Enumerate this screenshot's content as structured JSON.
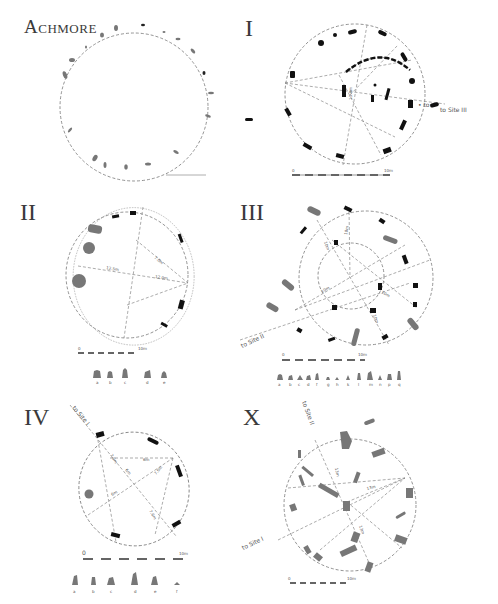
{
  "figure": {
    "panels": [
      {
        "id": "achmore",
        "title": "Achmore"
      },
      {
        "id": "site-1",
        "title": "I",
        "annotation": "to Site III",
        "radius_label": "13.4m",
        "scale": {
          "start": "0",
          "end": "10m"
        }
      },
      {
        "id": "site-2",
        "title": "II",
        "labels": [
          "12.5m",
          "12.0m",
          "7.0m"
        ],
        "scale": {
          "start": "0",
          "end": "10m"
        },
        "elevation_labels": [
          "a",
          "b",
          "c",
          "d",
          "e"
        ]
      },
      {
        "id": "site-3",
        "title": "III",
        "annotation": "to Site II",
        "labels": [
          "10m",
          "10m",
          "10m",
          "10m",
          "10m"
        ],
        "scale": {
          "start": "0",
          "end": "10m"
        },
        "elevation_labels": [
          "a",
          "b",
          "c",
          "d",
          "f",
          "g",
          "h",
          "k",
          "l",
          "m",
          "n",
          "p",
          "q"
        ]
      },
      {
        "id": "site-4",
        "title": "IV",
        "annotation": "to Site I",
        "labels": [
          "7.6m",
          "6m",
          "6m",
          "7.6m",
          "6m",
          "7.6m"
        ],
        "scale": {
          "start": "0",
          "end": "10m"
        },
        "elevation_labels": [
          "a",
          "b",
          "c",
          "d",
          "e",
          "f"
        ]
      },
      {
        "id": "site-10",
        "title": "X",
        "annotations": [
          "to Site II",
          "to Site I"
        ],
        "labels": [
          "13m",
          "13m",
          "13m"
        ],
        "scale": {
          "start": "0",
          "end": "10m"
        }
      }
    ]
  }
}
